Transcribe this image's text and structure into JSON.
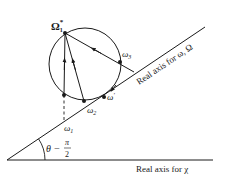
{
  "figure": {
    "colors": {
      "ink": "#1a1a1a",
      "background": "#ffffff"
    },
    "axes": {
      "horizontal_label": "Real axis for χ",
      "tilted_label": "Real axis for ω, Ω",
      "angle_label_left": "θ −",
      "angle_label_num": "π",
      "angle_label_den": "2"
    },
    "points": {
      "omega_star": {
        "base": "Ω",
        "sub": "1",
        "sup": "*"
      },
      "omega1": {
        "base": "ω",
        "sub": "1"
      },
      "omega2": {
        "base": "ω",
        "sub": "2"
      },
      "omega3": {
        "base": "ω",
        "sub": "3"
      },
      "omega_prime": {
        "base": "ω",
        "sup": "′"
      }
    }
  }
}
